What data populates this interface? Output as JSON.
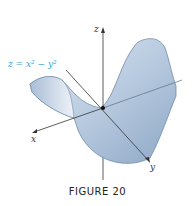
{
  "figure": {
    "equation_label": "z = x² − y²",
    "axes": {
      "x": "x",
      "y": "y",
      "z": "z"
    },
    "caption": "FIGURE 20",
    "colors": {
      "surface": "#c7d6e8",
      "surface_dark": "#8ea8c6",
      "edge": "#6f8aa8",
      "axis": "#333333",
      "label": "#3aa6d8"
    }
  }
}
